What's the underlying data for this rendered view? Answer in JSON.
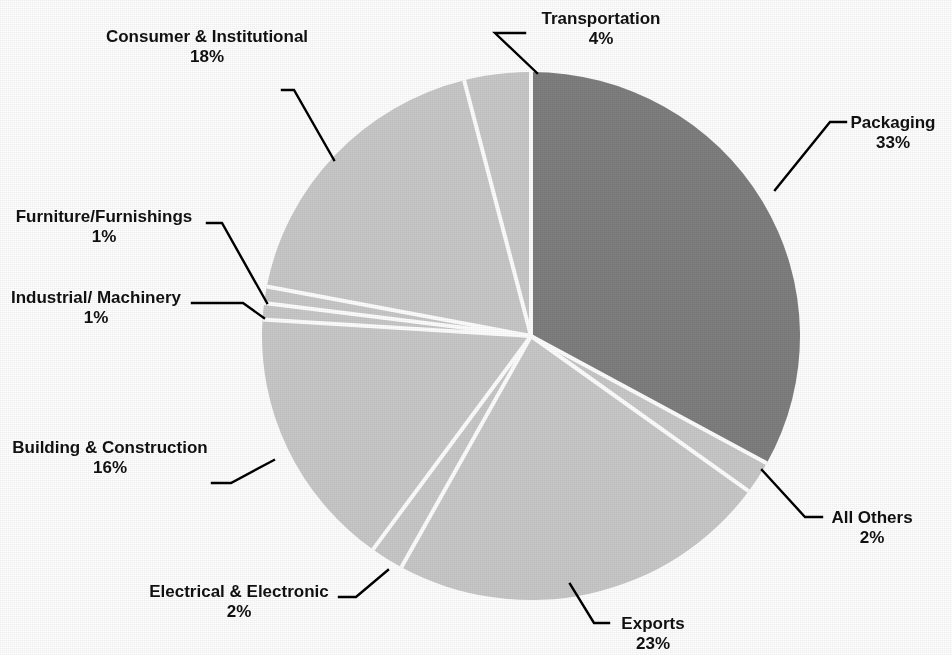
{
  "chart_data": {
    "type": "pie",
    "title": "",
    "subtitle": "",
    "xlabel": "",
    "ylabel": "",
    "legend_position": "none",
    "grid": false,
    "value_unit": "%",
    "start_angle_deg": 0,
    "direction": "clockwise",
    "categories": [
      "Packaging",
      "All Others",
      "Exports",
      "Electrical & Electronic",
      "Building & Construction",
      "Industrial/ Machinery",
      "Furniture/Furnishings",
      "Consumer & Institutional",
      "Transportation"
    ],
    "values": [
      33,
      2,
      23,
      2,
      16,
      1,
      1,
      18,
      4
    ],
    "slices": [
      {
        "label": "Packaging",
        "value": 33,
        "value_text": "33%",
        "color": "#7f7f7f",
        "emphasis": "dark",
        "start_pct": 0,
        "end_pct": 33
      },
      {
        "label": "All Others",
        "value": 2,
        "value_text": "2%",
        "color": "#c9c9c9",
        "emphasis": "light",
        "start_pct": 33,
        "end_pct": 35
      },
      {
        "label": "Exports",
        "value": 23,
        "value_text": "23%",
        "color": "#c9c9c9",
        "emphasis": "light",
        "start_pct": 35,
        "end_pct": 58
      },
      {
        "label": "Electrical & Electronic",
        "value": 2,
        "value_text": "2%",
        "color": "#c9c9c9",
        "emphasis": "light",
        "start_pct": 58,
        "end_pct": 60
      },
      {
        "label": "Building & Construction",
        "value": 16,
        "value_text": "16%",
        "color": "#c9c9c9",
        "emphasis": "light",
        "start_pct": 60,
        "end_pct": 76
      },
      {
        "label": "Industrial/ Machinery",
        "value": 1,
        "value_text": "1%",
        "color": "#c9c9c9",
        "emphasis": "light",
        "start_pct": 76,
        "end_pct": 77
      },
      {
        "label": "Furniture/Furnishings",
        "value": 1,
        "value_text": "1%",
        "color": "#c9c9c9",
        "emphasis": "light",
        "start_pct": 77,
        "end_pct": 78
      },
      {
        "label": "Consumer & Institutional",
        "value": 18,
        "value_text": "18%",
        "color": "#c9c9c9",
        "emphasis": "light",
        "start_pct": 78,
        "end_pct": 96
      },
      {
        "label": "Transportation",
        "value": 4,
        "value_text": "4%",
        "color": "#c9c9c9",
        "emphasis": "light",
        "start_pct": 96,
        "end_pct": 100
      }
    ],
    "total": 100,
    "colors": {
      "highlight_slice": "#7f7f7f",
      "regular_slice": "#c9c9c9",
      "separator": "#ffffff",
      "leader_line": "#000000",
      "label_text": "#111111",
      "background": "#ffffff"
    }
  },
  "labels": {
    "transportation": {
      "name": "Transportation",
      "pct": "4%"
    },
    "consumer": {
      "name": "Consumer & Institutional",
      "pct": "18%"
    },
    "furniture": {
      "name": "Furniture/Furnishings",
      "pct": "1%"
    },
    "industrial": {
      "name": "Industrial/ Machinery",
      "pct": "1%"
    },
    "building": {
      "name": "Building & Construction",
      "pct": "16%"
    },
    "electrical": {
      "name": "Electrical & Electronic",
      "pct": "2%"
    },
    "exports": {
      "name": "Exports",
      "pct": "23%"
    },
    "all_others": {
      "name": "All Others",
      "pct": "2%"
    },
    "packaging": {
      "name": "Packaging",
      "pct": "33%"
    }
  }
}
